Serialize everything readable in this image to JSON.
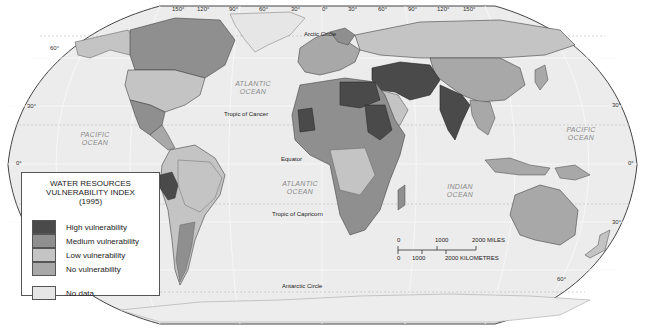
{
  "map": {
    "projection_labels": {
      "top_longitudes": [
        "150°",
        "120°",
        "90°",
        "60°",
        "30°",
        "0°",
        "30°",
        "60°",
        "90°",
        "120°",
        "150°"
      ],
      "left_latitudes": [
        "60°",
        "30°",
        "0°"
      ],
      "right_latitudes": [
        "30°",
        "0°",
        "30°",
        "60°"
      ]
    },
    "reference_lines": {
      "arctic_circle": "Arctic Circle",
      "tropic_of_cancer": "Tropic of Cancer",
      "equator": "Equator",
      "tropic_of_capricorn": "Tropic of Capricorn",
      "antarctic_circle": "Antarctic Circle"
    },
    "oceans": {
      "atlantic_north": [
        "ATLANTIC",
        "OCEAN"
      ],
      "atlantic_south": [
        "ATLANTIC",
        "OCEAN"
      ],
      "pacific_west": [
        "PACIFIC",
        "OCEAN"
      ],
      "pacific_east": [
        "PACIFIC",
        "OCEAN"
      ],
      "indian": [
        "INDIAN",
        "OCEAN"
      ]
    },
    "colors": {
      "high": "#4a4a4a",
      "medium": "#8f8f8f",
      "low": "#c4c4c4",
      "none": "#a8a8a8",
      "no_data": "#e6e6e6",
      "sea": "#ececec",
      "outline": "#444444"
    }
  },
  "legend": {
    "title_lines": [
      "WATER RESOURCES",
      "VULNERABILITY INDEX",
      "(1995)"
    ],
    "items": [
      {
        "label": "High vulnerability",
        "color": "#4a4a4a"
      },
      {
        "label": "Medium vulnerability",
        "color": "#8f8f8f"
      },
      {
        "label": "Low vulnerability",
        "color": "#c4c4c4"
      },
      {
        "label": "No vulnerability",
        "color": "#a8a8a8"
      },
      {
        "label": "No data",
        "color": "#e6e6e6"
      }
    ]
  },
  "scale_bar": {
    "miles_labels": [
      "0",
      "1000",
      "2000 MILES"
    ],
    "km_labels": [
      "0",
      "1000",
      "2000 KILOMETRES"
    ]
  }
}
